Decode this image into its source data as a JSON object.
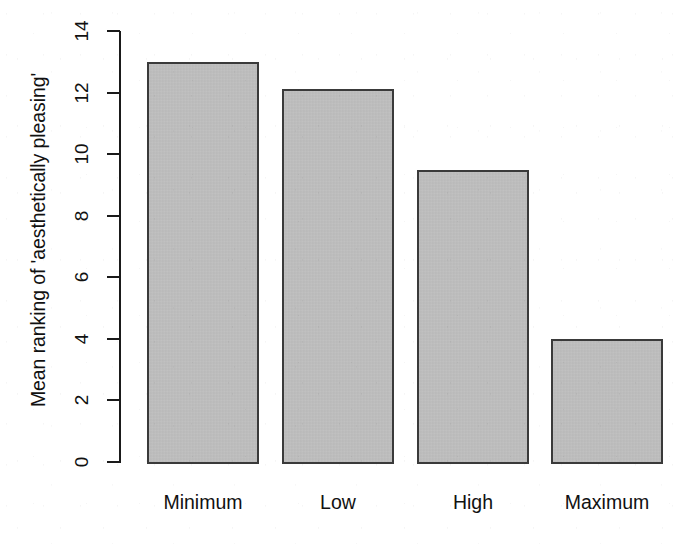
{
  "chart_data": {
    "type": "bar",
    "title": "",
    "xlabel": "",
    "ylabel": "Mean ranking of 'aesthetically pleasing'",
    "categories": [
      "Minimum",
      "Low",
      "High",
      "Maximum"
    ],
    "values": [
      13.0,
      12.1,
      9.5,
      4.0
    ],
    "ylim": [
      0,
      14
    ],
    "yticks": [
      0,
      2,
      4,
      6,
      8,
      10,
      12,
      14
    ],
    "ytick_labels": [
      "0",
      "2",
      "4",
      "6",
      "8",
      "10",
      "12",
      "14"
    ],
    "grid": false,
    "legend": false,
    "bar_fill_color": "#bfbfbf",
    "bar_border_color": "#3a3a3a",
    "axis_color": "#1a1a1a",
    "background_color": "#ffffff"
  },
  "axis": {
    "y_label": "Mean ranking of 'aesthetically pleasing'"
  }
}
